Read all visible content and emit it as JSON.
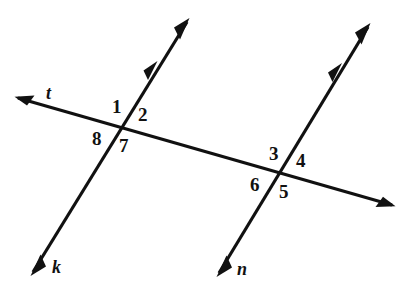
{
  "figure": {
    "background_color": "#ffffff",
    "stroke_color": "#111111",
    "width": 417,
    "height": 282
  },
  "lines": [
    {
      "id": "t",
      "label": "t",
      "role": "transversal",
      "label_x": 46,
      "label_y": 84,
      "x1": 18,
      "y1": 98,
      "x2": 392,
      "y2": 205,
      "arrow_start": true,
      "arrow_end": true,
      "tick_marks": 0
    },
    {
      "id": "k",
      "label": "k",
      "role": "parallel-line",
      "label_x": 52,
      "label_y": 258,
      "x1": 187,
      "y1": 22,
      "x2": 33,
      "y2": 272,
      "arrow_start": true,
      "arrow_end": true,
      "tick_marks": 1
    },
    {
      "id": "n",
      "label": "n",
      "role": "parallel-line",
      "label_x": 237,
      "label_y": 260,
      "x1": 368,
      "y1": 27,
      "x2": 219,
      "y2": 273,
      "arrow_start": true,
      "arrow_end": true,
      "tick_marks": 1
    }
  ],
  "intersections": [
    {
      "id": "t-k",
      "lines": [
        "t",
        "k"
      ],
      "x": 125,
      "y": 129
    },
    {
      "id": "t-n",
      "lines": [
        "t",
        "n"
      ],
      "x": 285,
      "y": 175
    }
  ],
  "angle_labels": [
    {
      "number": "1",
      "intersection": "t-k",
      "position": "upper-left",
      "x": 112,
      "y": 97
    },
    {
      "number": "2",
      "intersection": "t-k",
      "position": "upper-right",
      "x": 138,
      "y": 105
    },
    {
      "number": "8",
      "intersection": "t-k",
      "position": "lower-left",
      "x": 92,
      "y": 129
    },
    {
      "number": "7",
      "intersection": "t-k",
      "position": "lower-right",
      "x": 119,
      "y": 136
    },
    {
      "number": "3",
      "intersection": "t-n",
      "position": "upper-left",
      "x": 269,
      "y": 144
    },
    {
      "number": "4",
      "intersection": "t-n",
      "position": "upper-right",
      "x": 296,
      "y": 151
    },
    {
      "number": "6",
      "intersection": "t-n",
      "position": "lower-left",
      "x": 250,
      "y": 175
    },
    {
      "number": "5",
      "intersection": "t-n",
      "position": "lower-right",
      "x": 279,
      "y": 182
    }
  ],
  "parallel_marks": [
    {
      "on_line": "k",
      "x": 155,
      "y": 68
    },
    {
      "on_line": "n",
      "x": 339,
      "y": 70
    }
  ]
}
